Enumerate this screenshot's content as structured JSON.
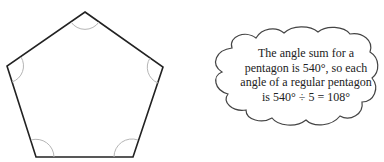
{
  "diagram": {
    "shape": "regular-pentagon",
    "vertices": [
      [
        85,
        12
      ],
      [
        163,
        67
      ],
      [
        133,
        157
      ],
      [
        36,
        157
      ],
      [
        7,
        66
      ]
    ],
    "angle_marks": 5,
    "stroke_color": "#222222",
    "arc_color": "#b0b0b0"
  },
  "callout": {
    "lines": [
      "The angle sum for a",
      "pentagon is 540°, so each",
      "angle of a regular pentagon",
      "is 540° ÷ 5 = 108°"
    ]
  }
}
